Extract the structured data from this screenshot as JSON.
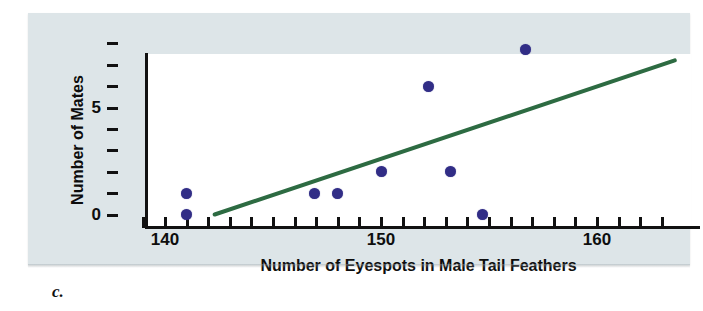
{
  "figure": {
    "caption": "c.",
    "panel_color": "#dde5e8",
    "plot_background": "#ffffff"
  },
  "chart_data": {
    "type": "scatter",
    "title": "",
    "xlabel": "Number of Eyespots in Male Tail Feathers",
    "ylabel": "Number of Mates",
    "xlim": [
      138.0,
      163.5
    ],
    "ylim": [
      0,
      8
    ],
    "grid": false,
    "legend": null,
    "x_ticks_labeled": [
      140,
      150,
      160
    ],
    "x_tick_labels": [
      "140",
      "150",
      "160"
    ],
    "y_ticks_labeled": [
      0,
      5
    ],
    "y_tick_labels": [
      "0",
      "5"
    ],
    "x_minor_tick_count": 24,
    "y_minor_tick_count": 9,
    "point_color": "#312d86",
    "points": [
      {
        "x": 141.0,
        "y": 1.0
      },
      {
        "x": 141.0,
        "y": 0.0
      },
      {
        "x": 146.9,
        "y": 1.0
      },
      {
        "x": 148.0,
        "y": 1.0
      },
      {
        "x": 150.0,
        "y": 2.0
      },
      {
        "x": 152.2,
        "y": 6.0
      },
      {
        "x": 153.2,
        "y": 2.0
      },
      {
        "x": 154.7,
        "y": 0.0
      },
      {
        "x": 156.7,
        "y": 7.7
      }
    ],
    "trendline": {
      "color": "#2d6b42",
      "x_start": 142.3,
      "y_start": 0.0,
      "x_end": 163.6,
      "y_end": 7.2
    }
  },
  "axis": {
    "line_color": "#111111",
    "x_title": "Number of Eyespots in Male Tail Feathers",
    "y_title": "Number of Mates"
  }
}
